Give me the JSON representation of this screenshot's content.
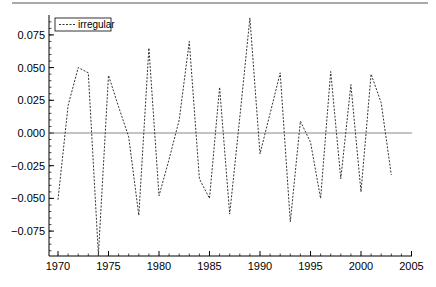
{
  "chart_data": {
    "type": "line",
    "title": "",
    "xlabel": "",
    "ylabel": "",
    "xlim": [
      1969,
      2005
    ],
    "ylim": [
      -0.095,
      0.09
    ],
    "grid": false,
    "legend_position": "upper-left",
    "x_ticks": [
      1970,
      1975,
      1980,
      1985,
      1990,
      1995,
      2000,
      2005
    ],
    "x_tick_labels": [
      "1970",
      "1975",
      "1980",
      "1985",
      "1990",
      "1995",
      "2000",
      "2005"
    ],
    "y_ticks": [
      0.075,
      0.05,
      0.025,
      0.0,
      -0.025,
      -0.05,
      -0.075
    ],
    "y_tick_labels": [
      "0.075",
      "0.050",
      "0.025",
      "0.000",
      "−0.025",
      "−0.050",
      "−0.075"
    ],
    "reference_line": {
      "y": 0.0,
      "color": "#888888"
    },
    "x": [
      1970,
      1971,
      1972,
      1973,
      1974,
      1975,
      1976,
      1977,
      1978,
      1979,
      1980,
      1981,
      1982,
      1983,
      1984,
      1985,
      1986,
      1987,
      1988,
      1989,
      1990,
      1991,
      1992,
      1993,
      1994,
      1995,
      1996,
      1997,
      1998,
      1999,
      2000,
      2001,
      2002,
      2003
    ],
    "series": [
      {
        "name": "irregular",
        "style": "dashed",
        "color": "#333333",
        "values": [
          -0.051,
          0.021,
          0.05,
          0.046,
          -0.093,
          0.044,
          0.02,
          -0.003,
          -0.063,
          0.065,
          -0.048,
          -0.02,
          0.01,
          0.07,
          -0.035,
          -0.05,
          0.035,
          -0.062,
          0.012,
          0.088,
          -0.016,
          0.015,
          0.046,
          -0.068,
          0.009,
          -0.007,
          -0.05,
          0.047,
          -0.035,
          0.037,
          -0.045,
          0.045,
          0.023,
          -0.032
        ]
      }
    ]
  },
  "legend": {
    "label": "irregular"
  }
}
